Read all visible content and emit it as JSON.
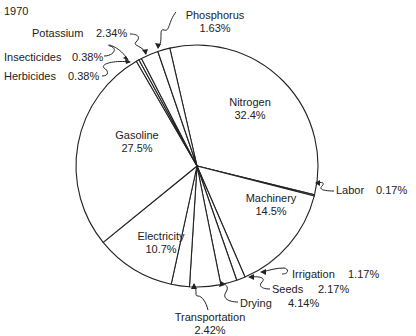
{
  "chart_data": {
    "type": "pie",
    "title": "1970",
    "start_angle_deg": -13,
    "direction": "clockwise",
    "slices": [
      {
        "label": "Nitrogen",
        "value": 32.4,
        "display": "32.4%"
      },
      {
        "label": "Labor",
        "value": 0.17,
        "display": "0.17%"
      },
      {
        "label": "Machinery",
        "value": 14.5,
        "display": "14.5%"
      },
      {
        "label": "Irrigation",
        "value": 1.17,
        "display": "1.17%"
      },
      {
        "label": "Seeds",
        "value": 2.17,
        "display": "2.17%"
      },
      {
        "label": "Drying",
        "value": 4.14,
        "display": "4.14%"
      },
      {
        "label": "Transportation",
        "value": 2.42,
        "display": "2.42%"
      },
      {
        "label": "Electricity",
        "value": 10.7,
        "display": "10.7%"
      },
      {
        "label": "Gasoline",
        "value": 27.5,
        "display": "27.5%"
      },
      {
        "label": "Herbicides",
        "value": 0.38,
        "display": "0.38%"
      },
      {
        "label": "Insecticides",
        "value": 0.38,
        "display": "0.38%"
      },
      {
        "label": "Potassium",
        "value": 2.34,
        "display": "2.34%"
      },
      {
        "label": "Phosphorus",
        "value": 1.63,
        "display": "1.63%"
      }
    ],
    "center": [
      197,
      166
    ],
    "radius": 121
  },
  "labels": {
    "year": "1970",
    "nitrogen": {
      "name": "Nitrogen",
      "pct": "32.4%"
    },
    "gasoline": {
      "name": "Gasoline",
      "pct": "27.5%"
    },
    "machinery": {
      "name": "Machinery",
      "pct": "14.5%"
    },
    "electricity": {
      "name": "Electricity",
      "pct": "10.7%"
    },
    "phosphorus": {
      "name": "Phosphorus",
      "pct": "1.63%"
    },
    "potassium": {
      "name": "Potassium",
      "pct": "2.34%"
    },
    "insecticides": {
      "name": "Insecticides",
      "pct": "0.38%"
    },
    "herbicides": {
      "name": "Herbicides",
      "pct": "0.38%"
    },
    "labor": {
      "name": "Labor",
      "pct": "0.17%"
    },
    "irrigation": {
      "name": "Irrigation",
      "pct": "1.17%"
    },
    "seeds": {
      "name": "Seeds",
      "pct": "2.17%"
    },
    "drying": {
      "name": "Drying",
      "pct": "4.14%"
    },
    "transportation": {
      "name": "Transportation",
      "pct": "2.42%"
    }
  }
}
